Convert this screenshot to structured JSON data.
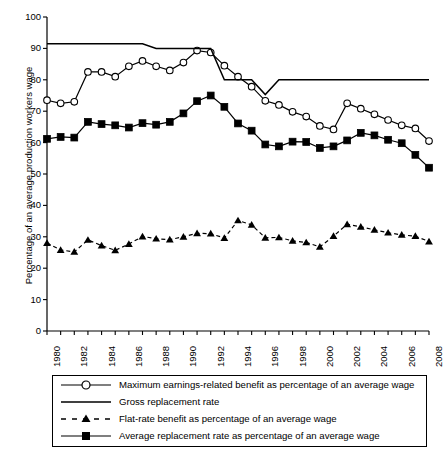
{
  "chart_data": {
    "type": "line",
    "title": "",
    "xlabel": "",
    "ylabel": "Percentage of an average production workers wage",
    "ylim": [
      0,
      100
    ],
    "ytick_step": 10,
    "yticks": [
      0,
      10,
      20,
      30,
      40,
      50,
      60,
      70,
      80,
      90,
      100
    ],
    "xlim": [
      1980,
      2008
    ],
    "x": [
      1980,
      1981,
      1982,
      1983,
      1984,
      1985,
      1986,
      1987,
      1988,
      1989,
      1990,
      1991,
      1992,
      1993,
      1994,
      1995,
      1996,
      1997,
      1998,
      1999,
      2000,
      2001,
      2002,
      2003,
      2004,
      2005,
      2006,
      2007,
      2008
    ],
    "xtick_labels": [
      "1980",
      "1982",
      "1984",
      "1986",
      "1988",
      "1990",
      "1992",
      "1994",
      "1996",
      "1998",
      "2000",
      "2002",
      "2004",
      "2006",
      "2008"
    ],
    "xtick_values": [
      1980,
      1982,
      1984,
      1986,
      1988,
      1990,
      1992,
      1994,
      1996,
      1998,
      2000,
      2002,
      2004,
      2006,
      2008
    ],
    "minor_ticks_every": 1,
    "grid": false,
    "legend_position": "below-axes",
    "series": [
      {
        "name": "Maximum earnings-related benefit as percentage of an average wage",
        "marker": "open-circle",
        "linestyle": "solid",
        "color": "#000000",
        "values": [
          73.5,
          72.5,
          73.0,
          82.5,
          82.5,
          81.0,
          84.3,
          86.0,
          84.3,
          83.0,
          85.5,
          89.3,
          88.7,
          84.5,
          81.0,
          77.8,
          73.3,
          72.0,
          69.8,
          68.3,
          65.3,
          64.2,
          72.5,
          70.8,
          69.0,
          67.2,
          65.5,
          64.5,
          60.5
        ]
      },
      {
        "name": "Gross replacement rate",
        "marker": "none",
        "linestyle": "solid",
        "color": "#000000",
        "values": [
          91.5,
          91.5,
          91.5,
          91.5,
          91.5,
          91.5,
          91.5,
          91.5,
          90.0,
          90.0,
          90.0,
          90.0,
          90.0,
          80.0,
          80.0,
          80.0,
          75.3,
          80.0,
          80.0,
          80.0,
          80.0,
          80.0,
          80.0,
          80.0,
          80.0,
          80.0,
          80.0,
          80.0,
          80.0
        ]
      },
      {
        "name": "Flat-rate benefit as percentage of an average wage",
        "marker": "filled-triangle",
        "linestyle": "dashed",
        "color": "#000000",
        "values": [
          28.0,
          25.8,
          25.2,
          29.0,
          27.2,
          25.7,
          27.7,
          30.1,
          29.4,
          29.1,
          30.0,
          31.1,
          31.0,
          29.6,
          35.2,
          33.8,
          29.7,
          29.8,
          28.7,
          28.2,
          26.8,
          30.2,
          34.0,
          33.2,
          32.2,
          31.3,
          30.6,
          30.2,
          28.5
        ]
      },
      {
        "name": "Average replacement rate as percentage of an average wage",
        "marker": "filled-square",
        "linestyle": "solid",
        "color": "#000000",
        "values": [
          61.2,
          61.8,
          61.6,
          66.6,
          65.9,
          65.5,
          64.8,
          66.2,
          65.7,
          66.6,
          69.3,
          73.2,
          75.0,
          71.4,
          66.1,
          63.8,
          59.4,
          58.8,
          60.3,
          60.2,
          58.3,
          58.8,
          60.7,
          63.1,
          62.3,
          60.9,
          59.8,
          56.1,
          52.0
        ]
      }
    ]
  },
  "legend": {
    "items": [
      {
        "label": "Maximum earnings-related benefit as percentage of an average wage",
        "key": "line-open-circle"
      },
      {
        "label": "Gross replacement rate",
        "key": "line-plain"
      },
      {
        "label": "Flat-rate benefit as percentage of an average wage",
        "key": "dashed-triangle"
      },
      {
        "label": "Average replacement rate as percentage of an average wage",
        "key": "line-filled-square"
      }
    ]
  }
}
